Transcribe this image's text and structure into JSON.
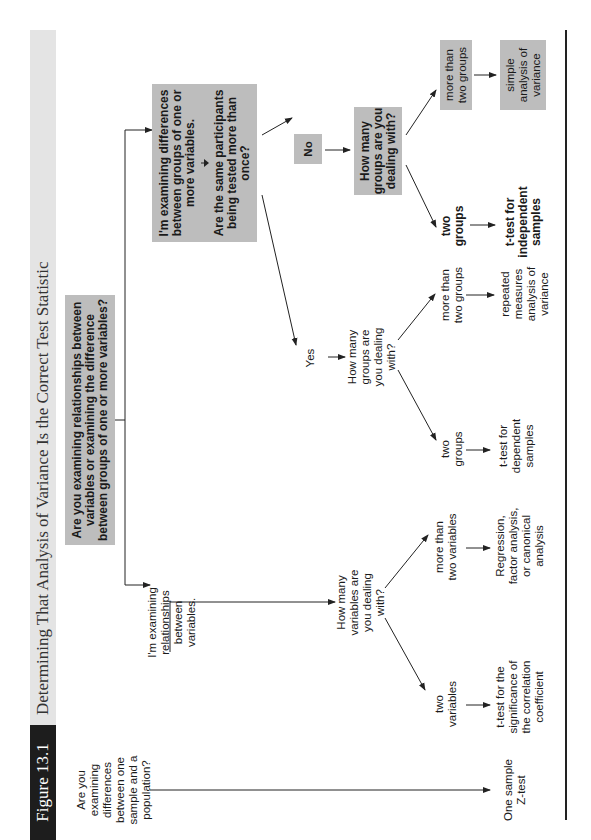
{
  "figure": {
    "label": "Figure 13.1",
    "title": "Determining That Analysis of Variance Is the Correct Test Statistic"
  },
  "nodes": {
    "root_question": "Are you examining relationships between variables or examining the difference between groups of one or more variables?",
    "one_sample_question": "Are you examining differences between one sample and a population?",
    "one_sample_result": "One sample Z-test",
    "relationships": "I'm examining relationships between variables.",
    "how_many_variables": "How many variables are you dealing with?",
    "two_variables": "two variables",
    "more_than_two_variables": "more than two variables",
    "t_test_correlation": "t-test for the significance of the correlation coefficient",
    "regression": "Regression, factor analysis, or canonical analysis",
    "differences": "I'm examining differences between groups of one or more variables.",
    "same_participants": "Are the same participants being tested more than once?",
    "yes": "Yes",
    "no": "No",
    "how_many_groups_yes": "How many groups are you dealing with?",
    "two_groups_dep": "two groups",
    "more_than_two_groups_dep": "more than two groups",
    "t_test_dependent": "t-test for dependent samples",
    "repeated_measures": "repeated measures analysis of variance",
    "how_many_groups_no": "How many groups are you dealing with?",
    "two_groups_ind": "two groups",
    "more_than_two_groups_ind": "more than two groups",
    "t_test_independent": "t-test for independent samples",
    "simple_anova": "simple analysis of variance"
  },
  "colors": {
    "box_fill": "#bdbdbd",
    "label_fill": "#1d1d1d",
    "titlebar_fill": "#e4e4e4",
    "line": "#222222"
  }
}
